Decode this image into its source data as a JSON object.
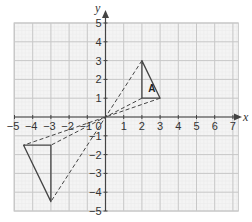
{
  "chart_data": {
    "type": "diagram",
    "title": "",
    "xlabel": "x",
    "ylabel": "y",
    "xlim": [
      -5,
      7
    ],
    "ylim": [
      -5,
      5
    ],
    "grid": true,
    "x_ticks": [
      "-5",
      "-4",
      "-3",
      "-2",
      "-1",
      "1",
      "2",
      "3",
      "4",
      "5",
      "6",
      "7"
    ],
    "y_ticks": [
      "5",
      "4",
      "3",
      "2",
      "1",
      "-1",
      "-2",
      "-3",
      "-4",
      "-5"
    ],
    "origin_label": "0",
    "shapes": [
      {
        "name": "A",
        "label": "A",
        "style": "solid",
        "vertices": [
          [
            2,
            3
          ],
          [
            2,
            1
          ],
          [
            3,
            1
          ]
        ]
      },
      {
        "name": "image",
        "label": "",
        "style": "solid",
        "vertices": [
          [
            -3,
            -1.5
          ],
          [
            -4.5,
            -1.5
          ],
          [
            -3,
            -4.5
          ]
        ]
      }
    ],
    "construction_lines": [
      {
        "from": [
          2,
          3
        ],
        "to": [
          -3,
          -4.5
        ],
        "style": "dashed"
      },
      {
        "from": [
          3,
          1
        ],
        "to": [
          -4.5,
          -1.5
        ],
        "style": "dashed"
      },
      {
        "from": [
          2,
          1
        ],
        "to": [
          -3,
          -1.5
        ],
        "style": "dashed"
      }
    ]
  },
  "labels": {
    "x_axis": "x",
    "y_axis": "y",
    "origin": "0",
    "triangle_a": "A"
  },
  "colors": {
    "grid_major": "#c8c8c8",
    "grid_minor": "#ebebeb",
    "grid_bg": "#f4f4f4",
    "axis": "#444444",
    "shape": "#444444"
  }
}
